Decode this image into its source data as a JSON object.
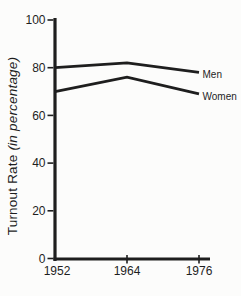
{
  "figure": {
    "background": "#fcfcfb",
    "ink": "#1e1e1e"
  },
  "chart_data": {
    "type": "line",
    "x": [
      1952,
      1964,
      1976
    ],
    "xticks": [
      "1952",
      "1964",
      "1976"
    ],
    "yticks": [
      0,
      20,
      40,
      60,
      80,
      100
    ],
    "ylim": [
      0,
      100
    ],
    "xlabel": "",
    "ylabel": "Turnout Rate (in percentage)",
    "ylabel_main": "Turnout Rate ",
    "ylabel_italic": "(in percentage)",
    "grid": false,
    "legend_position": "line-end-labels",
    "series": [
      {
        "name": "Men",
        "values": [
          80,
          82,
          78
        ]
      },
      {
        "name": "Women",
        "values": [
          70,
          76,
          69
        ]
      }
    ]
  }
}
